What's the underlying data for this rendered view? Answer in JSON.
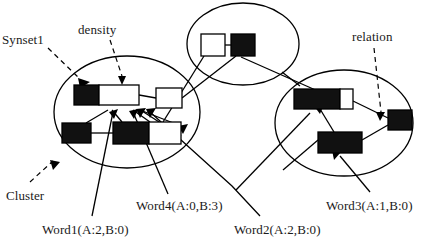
{
  "figure": {
    "type": "diagram",
    "background_color": "#ffffff",
    "stroke_color": "#000000",
    "node_fill_black": "#111111",
    "node_fill_white": "#ffffff"
  },
  "annotations": {
    "synset1": "Synset1",
    "density": "density",
    "relation": "relation",
    "cluster": "Cluster",
    "word1": "Word1(A:2,B:0)",
    "word2": "Word2(A:2,B:0)",
    "word3": "Word3(A:1,B:0)",
    "word4": "Word4(A:0,B:3)"
  },
  "clusters": [
    {
      "id": "cluster-left",
      "cx": 127,
      "cy": 112,
      "rx": 73,
      "ry": 56,
      "rotation": 0
    },
    {
      "id": "cluster-top",
      "cx": 243,
      "cy": 44,
      "rx": 56,
      "ry": 41,
      "rotation": 0
    },
    {
      "id": "cluster-right",
      "cx": 344,
      "cy": 123,
      "rx": 69,
      "ry": 53,
      "rotation": 0
    }
  ],
  "synsets": [
    {
      "id": "synset-left-top",
      "cluster": "cluster-left",
      "boxes": [
        {
          "x": 74,
          "y": 85,
          "w": 25,
          "h": 20,
          "fill": "black"
        },
        {
          "x": 99,
          "y": 85,
          "w": 40,
          "h": 20,
          "fill": "white"
        }
      ]
    },
    {
      "id": "synset-left-right",
      "cluster": "cluster-left",
      "boxes": [
        {
          "x": 156,
          "y": 88,
          "w": 26,
          "h": 20,
          "fill": "white"
        }
      ]
    },
    {
      "id": "synset-left-bottom-a",
      "cluster": "cluster-left",
      "boxes": [
        {
          "x": 62,
          "y": 123,
          "w": 29,
          "h": 20,
          "fill": "black"
        }
      ]
    },
    {
      "id": "synset-left-bottom-b",
      "cluster": "cluster-left",
      "boxes": [
        {
          "x": 113,
          "y": 122,
          "w": 36,
          "h": 22,
          "fill": "black"
        },
        {
          "x": 149,
          "y": 122,
          "w": 32,
          "h": 22,
          "fill": "white"
        }
      ]
    },
    {
      "id": "synset-top",
      "cluster": "cluster-top",
      "boxes": [
        {
          "x": 201,
          "y": 34,
          "w": 24,
          "h": 22,
          "fill": "white"
        },
        {
          "x": 231,
          "y": 34,
          "w": 24,
          "h": 22,
          "fill": "black"
        }
      ]
    },
    {
      "id": "synset-right-top",
      "cluster": "cluster-right",
      "boxes": [
        {
          "x": 294,
          "y": 89,
          "w": 46,
          "h": 20,
          "fill": "black"
        },
        {
          "x": 340,
          "y": 89,
          "w": 13,
          "h": 20,
          "fill": "white"
        }
      ]
    },
    {
      "id": "synset-right-edge",
      "cluster": "cluster-right",
      "boxes": [
        {
          "x": 388,
          "y": 110,
          "w": 24,
          "h": 20,
          "fill": "black"
        }
      ]
    },
    {
      "id": "synset-right-bottom",
      "cluster": "cluster-right",
      "boxes": [
        {
          "x": 318,
          "y": 132,
          "w": 44,
          "h": 21,
          "fill": "black"
        }
      ]
    }
  ],
  "label_positions": {
    "synset1": {
      "left": 2,
      "top": 32
    },
    "density": {
      "left": 78,
      "top": 22
    },
    "relation": {
      "left": 352,
      "top": 29
    },
    "cluster": {
      "left": 6,
      "top": 188
    },
    "word1": {
      "left": 42,
      "top": 222
    },
    "word4": {
      "left": 136,
      "top": 198
    },
    "word2": {
      "left": 234,
      "top": 222
    },
    "word3": {
      "left": 326,
      "top": 198
    }
  }
}
